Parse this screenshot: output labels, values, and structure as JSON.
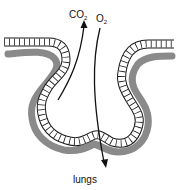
{
  "diagram": {
    "labels": {
      "co2": "CO",
      "co2_sub": "2",
      "o2": "O",
      "o2_sub": "2",
      "caption": "lungs"
    },
    "colors": {
      "capillary": "#8a8a8a",
      "cell_wall": "#1a1a1a",
      "arrow": "#111111",
      "background": "#ffffff"
    }
  }
}
